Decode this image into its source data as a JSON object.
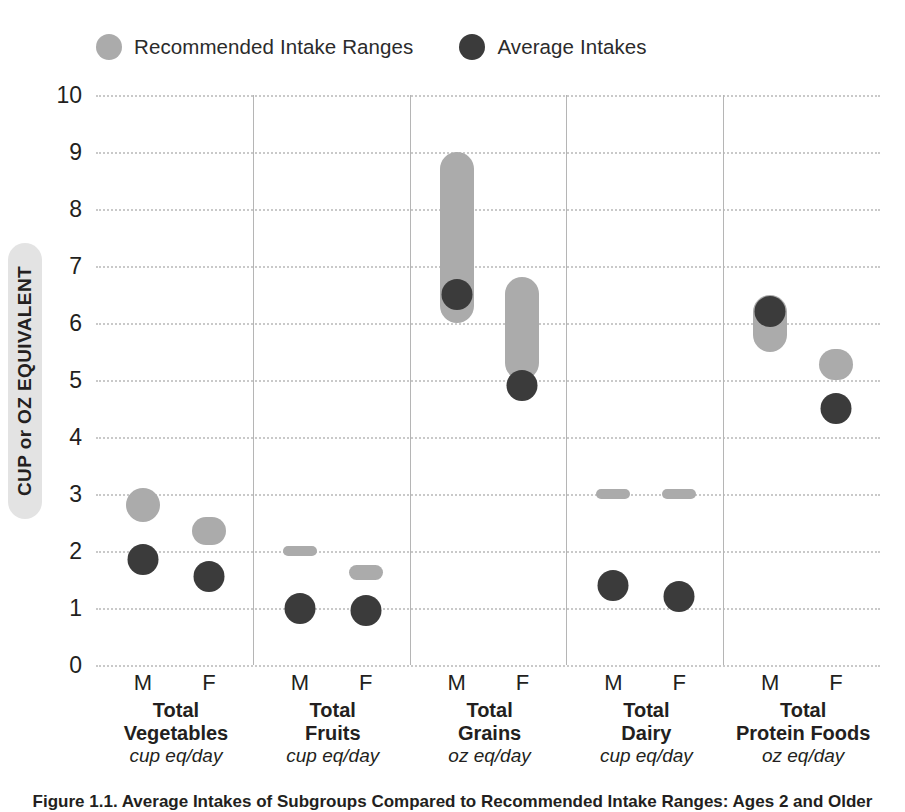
{
  "legend": {
    "items": [
      {
        "label": "Recommended Intake Ranges",
        "color": "#ababab",
        "icon": "circle-swatch-icon"
      },
      {
        "label": "Average Intakes",
        "color": "#3b3b3b",
        "icon": "circle-swatch-icon"
      }
    ]
  },
  "axis": {
    "y_title": "CUP or OZ EQUIVALENT",
    "ticks": [
      "10",
      "9",
      "8",
      "7",
      "6",
      "5",
      "4",
      "3",
      "2",
      "1",
      "0"
    ]
  },
  "caption": {
    "text": "Figure 1.1. Average Intakes of Subgroups Compared to Recommended Intake Ranges: Ages 2 and Older"
  },
  "chart_data": {
    "type": "bar",
    "xlabel": "",
    "ylabel": "CUP or OZ EQUIVALENT",
    "ylim": [
      0,
      10
    ],
    "ytick_values": [
      0,
      1,
      2,
      3,
      4,
      5,
      6,
      7,
      8,
      9,
      10
    ],
    "grid": true,
    "legend_position": "top-left",
    "legend_entries": [
      "Recommended Intake Ranges",
      "Average Intakes"
    ],
    "panels": [
      {
        "name": "Total Vegetables",
        "unit": "cup eq/day",
        "sexes": [
          {
            "sex": "M",
            "range_low": 2.5,
            "range_high": 3.1,
            "average": 1.85
          },
          {
            "sex": "F",
            "range_low": 2.1,
            "range_high": 2.6,
            "average": 1.55
          }
        ]
      },
      {
        "name": "Total Fruits",
        "unit": "cup eq/day",
        "sexes": [
          {
            "sex": "M",
            "range_low": 2.0,
            "range_high": 2.0,
            "average": 1.0
          },
          {
            "sex": "F",
            "range_low": 1.5,
            "range_high": 1.75,
            "average": 0.95
          }
        ]
      },
      {
        "name": "Total Grains",
        "unit": "oz eq/day",
        "sexes": [
          {
            "sex": "M",
            "range_low": 6.0,
            "range_high": 9.0,
            "average": 6.5
          },
          {
            "sex": "F",
            "range_low": 5.0,
            "range_high": 6.8,
            "average": 4.9
          }
        ]
      },
      {
        "name": "Total Dairy",
        "unit": "cup eq/day",
        "sexes": [
          {
            "sex": "M",
            "range_low": 3.0,
            "range_high": 3.0,
            "average": 1.4
          },
          {
            "sex": "F",
            "range_low": 3.0,
            "range_high": 3.0,
            "average": 1.2
          }
        ]
      },
      {
        "name": "Total Protein Foods",
        "unit": "oz eq/day",
        "sexes": [
          {
            "sex": "M",
            "range_low": 5.5,
            "range_high": 6.5,
            "average": 6.2
          },
          {
            "sex": "F",
            "range_low": 5.0,
            "range_high": 5.55,
            "average": 4.5
          }
        ]
      }
    ]
  }
}
